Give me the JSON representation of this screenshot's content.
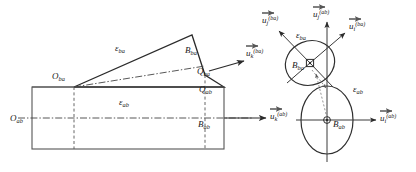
{
  "figure": {
    "background_color": "#ffffff",
    "line_color": "#2b2b2b"
  },
  "left_panel": {
    "name": "body-cross-section-view",
    "labels": {
      "origin_ab": "O",
      "origin_ab_sub": "ab",
      "origin_ba": "O",
      "origin_ba_sub": "ba",
      "point_Bba": "B",
      "point_Bba_sub": "ba",
      "point_Qba": "Q",
      "point_Qba_sub": "ba",
      "point_Qab": "Q",
      "point_Qab_sub": "ab",
      "point_Bab": "B",
      "point_Bab_sub": "ab",
      "eps_ba": "ε",
      "eps_ba_sub": "ba",
      "eps_ab": "ε",
      "eps_ab_sub": "ab"
    },
    "vectors": {
      "u_k_ba": "u",
      "u_k_ba_sub": "k",
      "u_k_ba_sup": "(ba)",
      "u_k_ab": "u",
      "u_k_ab_sub": "k",
      "u_k_ab_sup": "(ab)"
    }
  },
  "right_panel": {
    "name": "frame-vector-view",
    "labels": {
      "ellipse_ba_center": "B",
      "ellipse_ba_center_sub": "ba",
      "ellipse_ab_center": "B",
      "ellipse_ab_center_sub": "ab",
      "eps_ba": "ε",
      "eps_ba_sub": "ba",
      "eps_ab": "ε",
      "eps_ab_sub": "ab"
    },
    "vectors": {
      "u_j_ba": "u",
      "u_j_ba_sub": "j",
      "u_j_ba_sup": "(ba)",
      "u_j_ab": "u",
      "u_j_ab_sub": "j",
      "u_j_ab_sup": "(ab)",
      "u_i_ba": "u",
      "u_i_ba_sub": "i",
      "u_i_ba_sup": "(ba)",
      "u_i_ab": "u",
      "u_i_ab_sub": "i",
      "u_i_ab_sup": "(ab)"
    }
  }
}
